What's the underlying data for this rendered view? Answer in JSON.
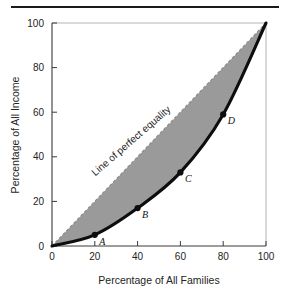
{
  "figure": {
    "background_color": "#ffffff",
    "has_top_rule": true,
    "top_rule_color": "#1a1a1a"
  },
  "chart_data": {
    "type": "area",
    "title": "",
    "xlabel": "Percentage of All Families",
    "ylabel": "Percentage of All Income",
    "xlim": [
      0,
      100
    ],
    "ylim": [
      0,
      100
    ],
    "xticks": [
      0,
      20,
      40,
      60,
      80,
      100
    ],
    "yticks": [
      0,
      20,
      40,
      60,
      80,
      100
    ],
    "xticklabels": [
      "0",
      "20",
      "40",
      "60",
      "80",
      "100"
    ],
    "yticklabels": [
      "0",
      "20",
      "40",
      "60",
      "80",
      "100"
    ],
    "grid": false,
    "legend": null,
    "series": [
      {
        "name": "Line of perfect equality",
        "style": "dashed-diagonal",
        "color": "#8c8c8c",
        "x": [
          0,
          100
        ],
        "values": [
          0,
          100
        ]
      },
      {
        "name": "Lorenz curve",
        "style": "thick-solid",
        "color": "#0d0d0d",
        "x": [
          0,
          20,
          40,
          60,
          80,
          100
        ],
        "values": [
          0,
          5,
          17,
          33,
          59,
          100
        ]
      }
    ],
    "shaded_region": {
      "label": "area between line of perfect equality and Lorenz curve",
      "color": "#9a9a9a"
    },
    "points": [
      {
        "label": "A",
        "x": 20,
        "y": 5
      },
      {
        "label": "B",
        "x": 40,
        "y": 17
      },
      {
        "label": "C",
        "x": 60,
        "y": 33
      },
      {
        "label": "D",
        "x": 80,
        "y": 59
      }
    ],
    "annotations": [
      {
        "text": "Line of perfect equality",
        "x": 38,
        "y": 46,
        "rotation": -41
      }
    ]
  }
}
